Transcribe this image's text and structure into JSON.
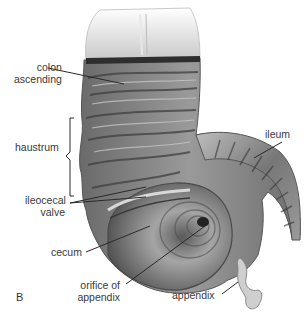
{
  "figure": {
    "panel_letter": "B",
    "colors": {
      "background": "#ffffff",
      "tissue_dark": "#4a4a4a",
      "tissue_mid": "#8a8a8a",
      "tissue_light": "#d8d8d8",
      "leader_line": "#2a2a2a",
      "label_text": "#3a3a3a"
    },
    "labels": {
      "colon_ascending_1": "colon",
      "colon_ascending_2": "ascending",
      "haustrum": "haustrum",
      "ileocecal_valve_1": "ileocecal",
      "ileocecal_valve_2": "valve",
      "cecum": "cecum",
      "orifice_1": "orifice of",
      "orifice_2": "appendix",
      "ileum": "ileum",
      "appendix": "appendix"
    }
  }
}
